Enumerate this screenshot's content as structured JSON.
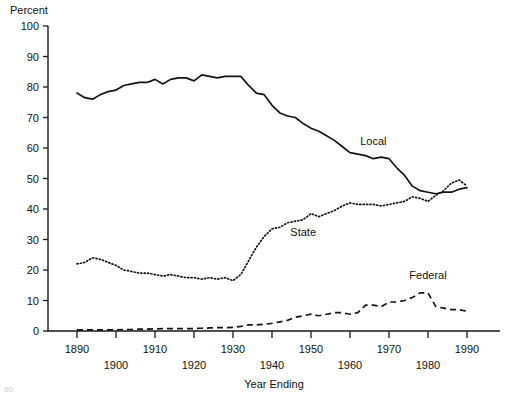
{
  "figure": {
    "unit_label": "Percent",
    "x_axis_title": "Year Ending",
    "corner_artifact": "00"
  },
  "axes": {
    "y_ticks": [
      "0",
      "10",
      "20",
      "30",
      "40",
      "50",
      "60",
      "70",
      "80",
      "90",
      "100"
    ],
    "x_ticks_upper": [
      "1890",
      "1910",
      "1930",
      "1950",
      "1970",
      "1990"
    ],
    "x_ticks_lower": [
      "1900",
      "1920",
      "1940",
      "1960",
      "1980"
    ]
  },
  "series_labels": {
    "local": "Local",
    "state": "State",
    "federal": "Federal"
  },
  "chart_data": {
    "type": "line",
    "title": "",
    "xlabel": "Year Ending",
    "ylabel": "Percent",
    "xlim": [
      1890,
      1992
    ],
    "ylim": [
      0,
      100
    ],
    "grid": false,
    "legend": "inline-labels",
    "x": [
      1890,
      1892,
      1894,
      1896,
      1898,
      1900,
      1902,
      1904,
      1906,
      1908,
      1910,
      1912,
      1914,
      1916,
      1918,
      1920,
      1922,
      1924,
      1926,
      1928,
      1930,
      1932,
      1934,
      1936,
      1938,
      1940,
      1942,
      1944,
      1946,
      1948,
      1950,
      1952,
      1954,
      1956,
      1958,
      1960,
      1962,
      1964,
      1966,
      1968,
      1970,
      1972,
      1974,
      1976,
      1978,
      1980,
      1982,
      1984,
      1986,
      1988,
      1990
    ],
    "series": [
      {
        "name": "Local",
        "style": "solid",
        "values": [
          78.0,
          76.5,
          76.0,
          77.5,
          78.5,
          79.0,
          80.5,
          81.0,
          81.5,
          81.5,
          82.5,
          81.0,
          82.5,
          83.0,
          83.0,
          82.0,
          84.0,
          83.5,
          83.0,
          83.5,
          83.5,
          83.5,
          80.5,
          78.0,
          77.5,
          74.0,
          71.5,
          70.5,
          70.0,
          68.0,
          66.5,
          65.5,
          64.0,
          62.5,
          60.5,
          58.5,
          58.0,
          57.5,
          56.5,
          57.0,
          56.5,
          53.5,
          51.0,
          47.5,
          46.0,
          45.5,
          45.0,
          45.5,
          45.5,
          46.5,
          47.0
        ]
      },
      {
        "name": "State",
        "style": "dotted",
        "values": [
          22.0,
          22.5,
          24.0,
          23.5,
          22.5,
          21.5,
          20.0,
          19.5,
          19.0,
          19.0,
          18.5,
          18.0,
          18.5,
          18.0,
          17.5,
          17.5,
          17.0,
          17.5,
          17.0,
          17.5,
          16.5,
          18.5,
          23.0,
          27.5,
          31.0,
          33.5,
          34.0,
          35.5,
          36.0,
          36.5,
          38.5,
          37.5,
          38.5,
          39.5,
          41.0,
          42.0,
          41.5,
          41.5,
          41.5,
          41.0,
          41.5,
          42.0,
          42.5,
          44.0,
          43.5,
          42.5,
          44.5,
          46.0,
          48.5,
          49.5,
          47.5
        ]
      },
      {
        "name": "Federal",
        "style": "dashed",
        "values": [
          0.4,
          0.4,
          0.4,
          0.4,
          0.4,
          0.4,
          0.5,
          0.5,
          0.6,
          0.6,
          0.7,
          0.8,
          0.8,
          0.8,
          0.8,
          0.8,
          0.9,
          1.0,
          1.1,
          1.1,
          1.2,
          1.5,
          2.0,
          2.0,
          2.2,
          2.5,
          3.0,
          3.5,
          4.5,
          5.0,
          5.5,
          5.0,
          5.5,
          6.0,
          6.0,
          5.5,
          6.0,
          8.5,
          8.5,
          8.0,
          9.5,
          9.5,
          10.0,
          11.0,
          12.5,
          12.5,
          8.0,
          7.5,
          7.0,
          7.0,
          6.5
        ]
      }
    ],
    "annotations": [
      {
        "text": "Local",
        "x": 1966,
        "y": 61
      },
      {
        "text": "State",
        "x": 1948,
        "y": 31
      },
      {
        "text": "Federal",
        "x": 1980,
        "y": 17
      }
    ]
  }
}
